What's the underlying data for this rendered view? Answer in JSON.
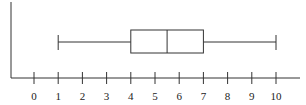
{
  "chart_data": {
    "type": "boxplot",
    "title": "",
    "xlabel": "",
    "ylabel": "",
    "orientation": "horizontal",
    "xlim": [
      0,
      10
    ],
    "ticks": [
      0,
      1,
      2,
      3,
      4,
      5,
      6,
      7,
      8,
      9,
      10
    ],
    "tick_labels": [
      "0",
      "1",
      "2",
      "3",
      "4",
      "5",
      "6",
      "7",
      "8",
      "9",
      "10"
    ],
    "grid": false,
    "series": [
      {
        "name": "",
        "min": 1,
        "q1": 4,
        "median": 5.5,
        "q3": 7,
        "max": 10
      }
    ]
  },
  "colors": {
    "line": "#333333",
    "background": "#ffffff"
  }
}
